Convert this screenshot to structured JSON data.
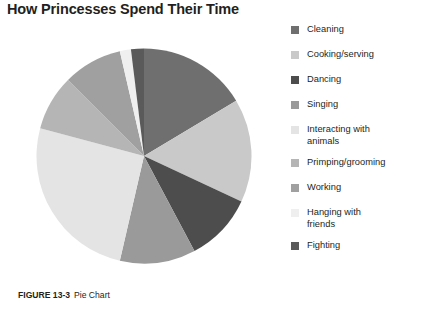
{
  "figure": {
    "title": "How Princesses Spend Their Time",
    "caption_label": "FIGURE 13-3",
    "caption_text": "Pie Chart"
  },
  "chart_data": {
    "type": "pie",
    "title": "How Princesses Spend Their Time",
    "xlabel": "",
    "ylabel": "",
    "legend_position": "right",
    "grid": false,
    "categories": [
      "Cleaning",
      "Cooking/serving",
      "Dancing",
      "Singing",
      "Interacting with animals",
      "Primping/grooming",
      "Working",
      "Hanging with friends",
      "Fighting"
    ],
    "values": [
      16.4,
      15.6,
      10.3,
      11.4,
      25.6,
      8.3,
      8.9,
      1.7,
      1.8
    ],
    "colors": [
      "#6f6f6f",
      "#c9c9c9",
      "#4d4d4d",
      "#9a9a9a",
      "#e4e4e4",
      "#b5b5b5",
      "#a0a0a0",
      "#efefef",
      "#5a5a5a"
    ],
    "start_angle_deg": 0,
    "direction": "clockwise",
    "slices": [
      {
        "label": "Cleaning",
        "value": 16.4,
        "start_deg": 0,
        "end_deg": 59,
        "color": "#6f6f6f"
      },
      {
        "label": "Cooking/serving",
        "value": 15.6,
        "start_deg": 59,
        "end_deg": 115,
        "color": "#c9c9c9"
      },
      {
        "label": "Dancing",
        "value": 10.3,
        "start_deg": 115,
        "end_deg": 152,
        "color": "#4d4d4d"
      },
      {
        "label": "Singing",
        "value": 11.4,
        "start_deg": 152,
        "end_deg": 193,
        "color": "#9a9a9a"
      },
      {
        "label": "Interacting with animals",
        "value": 25.6,
        "start_deg": 193,
        "end_deg": 285,
        "color": "#e4e4e4"
      },
      {
        "label": "Primping/grooming",
        "value": 8.3,
        "start_deg": 285,
        "end_deg": 315,
        "color": "#b5b5b5"
      },
      {
        "label": "Working",
        "value": 8.9,
        "start_deg": 315,
        "end_deg": 347,
        "color": "#a0a0a0"
      },
      {
        "label": "Hanging with friends",
        "value": 1.7,
        "start_deg": 347,
        "end_deg": 353,
        "color": "#efefef"
      },
      {
        "label": "Fighting",
        "value": 1.8,
        "start_deg": 353,
        "end_deg": 360,
        "color": "#5a5a5a"
      }
    ]
  },
  "legend": {
    "items": [
      {
        "label": "Cleaning",
        "color": "#6f6f6f"
      },
      {
        "label": "Cooking/serving",
        "color": "#c9c9c9"
      },
      {
        "label": "Dancing",
        "color": "#4d4d4d"
      },
      {
        "label": "Singing",
        "color": "#9a9a9a"
      },
      {
        "label": "Interacting with\nanimals",
        "color": "#e4e4e4"
      },
      {
        "label": "Primping/grooming",
        "color": "#b5b5b5"
      },
      {
        "label": "Working",
        "color": "#a0a0a0"
      },
      {
        "label": "Hanging with\nfriends",
        "color": "#efefef"
      },
      {
        "label": "Fighting",
        "color": "#5a5a5a"
      }
    ]
  }
}
